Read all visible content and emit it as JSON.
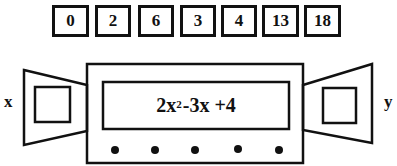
{
  "input_values": [
    "0",
    "2",
    "6",
    "3",
    "4",
    "13",
    "18"
  ],
  "machine": {
    "function_display": {
      "coefficient_a": "2x",
      "exponent": "2",
      "rest": "-3x +4"
    },
    "indicator_dots": 5
  },
  "labels": {
    "input": "x",
    "output": "y"
  },
  "colors": {
    "stroke": "#111111",
    "background": "#ffffff"
  }
}
